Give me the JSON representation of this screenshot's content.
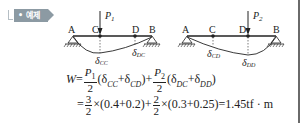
{
  "badge": {
    "label": "• 예제"
  },
  "diagram_left": {
    "load": "P",
    "load_sub": "1",
    "points": [
      "A",
      "C",
      "D",
      "B"
    ],
    "deflections": [
      {
        "label": "δ",
        "sub": "CC"
      },
      {
        "label": "δ",
        "sub": "DC"
      }
    ]
  },
  "diagram_right": {
    "load": "P",
    "load_sub": "2",
    "points": [
      "A",
      "C",
      "D",
      "B"
    ],
    "deflections": [
      {
        "label": "δ",
        "sub": "CD"
      },
      {
        "label": "δ",
        "sub": "DD"
      }
    ]
  },
  "equation": {
    "line1": {
      "lhs": "W",
      "eq": "=",
      "frac1_num": "P",
      "frac1_num_sub": "1",
      "frac1_den": "2",
      "paren1_open": "(δ",
      "s1": "CC",
      "plus1": "+δ",
      "s2": "CD",
      "paren1_close": ")",
      "plus_mid": "+",
      "frac2_num": "P",
      "frac2_num_sub": "2",
      "frac2_den": "2",
      "paren2_open": "(δ",
      "s3": "DC",
      "plus2": "+δ",
      "s4": "DD",
      "paren2_close": ")"
    },
    "line2": {
      "eq": "=",
      "frac1_num": "3",
      "frac1_den": "2",
      "term1": "×(0.4+0.2)+",
      "frac2_num": "2",
      "frac2_den": "2",
      "term2": "×(0.3+0.25)=1.45tf · m"
    }
  }
}
